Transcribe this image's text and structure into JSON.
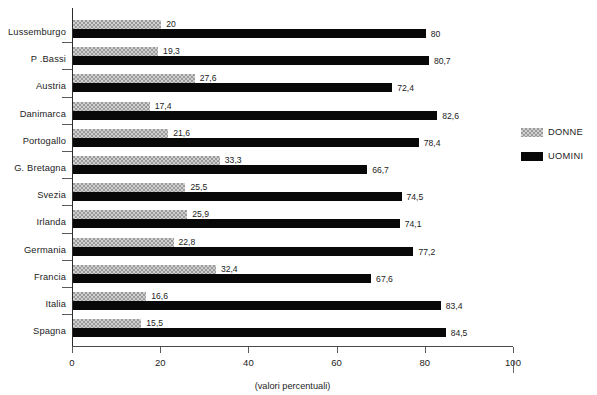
{
  "chart_data": {
    "type": "bar",
    "orientation": "horizontal",
    "title": "",
    "xlabel": "(valori percentuali)",
    "ylabel": "",
    "xlim": [
      0,
      100
    ],
    "xticks": [
      0,
      20,
      40,
      60,
      80,
      100
    ],
    "xtick_labels": [
      "0",
      "20",
      "40",
      "60",
      "80",
      "100"
    ],
    "grid": false,
    "legend_position": "right",
    "categories": [
      "Lussemburgo",
      "P .Bassi",
      "Austria",
      "Danimarca",
      "Portogallo",
      "G. Bretagna",
      "Svezia",
      "Irlanda",
      "Germania",
      "Francia",
      "Italia",
      "Spagna"
    ],
    "series": [
      {
        "name": "DONNE",
        "color": "#9b9b9b",
        "pattern": "checkered",
        "values": [
          20,
          19.3,
          27.6,
          17.4,
          21.6,
          33.3,
          25.5,
          25.9,
          22.8,
          32.4,
          16.6,
          15.5
        ],
        "labels": [
          "20",
          "19,3",
          "27,6",
          "17,4",
          "21,6",
          "33,3",
          "25,5",
          "25,9",
          "22,8",
          "32,4",
          "16,6",
          "15,5"
        ]
      },
      {
        "name": "UOMINI",
        "color": "#080808",
        "pattern": "solid",
        "values": [
          80,
          80.7,
          72.4,
          82.6,
          78.4,
          66.7,
          74.5,
          74.1,
          77.2,
          67.6,
          83.4,
          84.5
        ],
        "labels": [
          "80",
          "80,7",
          "72,4",
          "82,6",
          "78,4",
          "66,7",
          "74,5",
          "74,1",
          "77,2",
          "67,6",
          "83,4",
          "84,5"
        ]
      }
    ]
  },
  "legend": {
    "items": [
      {
        "label": "DONNE",
        "swatch": "donne-swatch"
      },
      {
        "label": "UOMINI",
        "swatch": "uomini-swatch"
      }
    ]
  }
}
